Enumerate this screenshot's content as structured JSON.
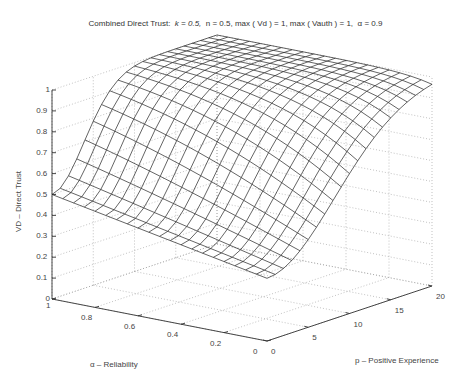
{
  "chart_data": {
    "type": "surface3d",
    "title_parts": {
      "prefix": "Combined Direct Trust:",
      "k": "k = 0.5,",
      "n": "n = 0.5,",
      "vd": "max ( Vd ) = 1,",
      "vauth": "max ( Vauth ) = 1,",
      "alpha": "α = 0.9"
    },
    "xlabel": "α – Reliability",
    "ylabel": "p – Positive Experience",
    "zlabel": "VD – Direct Trust",
    "x_axis": {
      "name": "alpha",
      "range": [
        0,
        1
      ],
      "ticks": [
        "1",
        "0.8",
        "0.6",
        "0.4",
        "0.2",
        "0"
      ]
    },
    "y_axis": {
      "name": "p",
      "range": [
        0,
        20
      ],
      "ticks": [
        "0",
        "5",
        "10",
        "15",
        "20"
      ]
    },
    "z_axis": {
      "range": [
        0,
        1
      ],
      "ticks": [
        "0",
        "0.1",
        "0.2",
        "0.3",
        "0.4",
        "0.5",
        "0.6",
        "0.7",
        "0.8",
        "0.9",
        "1"
      ]
    },
    "grid": true,
    "mesh": {
      "alpha_steps": 21,
      "p_steps": 21
    },
    "surface_samples": [
      {
        "alpha": 1.0,
        "p": 0,
        "z": 0.5
      },
      {
        "alpha": 0.0,
        "p": 0,
        "z": 0.3
      },
      {
        "alpha": 1.0,
        "p": 20,
        "z": 1.0
      },
      {
        "alpha": 0.0,
        "p": 20,
        "z": 1.0
      },
      {
        "alpha": 0.5,
        "p": 5,
        "z": 0.85
      }
    ],
    "line_color": "#222222",
    "grid_color": "#999999"
  }
}
